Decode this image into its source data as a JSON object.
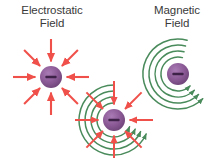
{
  "figure": {
    "background_color": "#ffffff",
    "width": 215,
    "height": 158,
    "type": "scientific-illustration"
  },
  "labels": {
    "electrostatic": "Electrostatic\nField",
    "magnetic": "Magnetic\nField"
  },
  "colors": {
    "charge_fill": "#8B5A96",
    "charge_fill_light": "#A36FAE",
    "charge_fill_dark": "#6E4478",
    "charge_sign": "#3F2248",
    "arrow_red": "#F0504A",
    "field_green": "#4A8B5C",
    "label_text": "#3a3a3a"
  },
  "diagrams": [
    {
      "id": "electrostatic",
      "name": "electrostatic-field-diagram",
      "charge_sign": "minus",
      "charge_radius": 11,
      "arrow_count": 8,
      "arrow_direction": "inward",
      "arrow_angles_deg": [
        0,
        45,
        90,
        135,
        180,
        225,
        270,
        315
      ],
      "field_rings": 0
    },
    {
      "id": "combined",
      "name": "combined-field-diagram",
      "charge_sign": "minus",
      "charge_radius": 11,
      "arrow_count": 8,
      "arrow_direction": "inward",
      "arrow_angles_deg": [
        0,
        45,
        90,
        135,
        180,
        225,
        270,
        315
      ],
      "field_rings": 4,
      "ring_radii": [
        17,
        23,
        29,
        35
      ]
    },
    {
      "id": "magnetic",
      "name": "magnetic-field-diagram",
      "charge_sign": "minus",
      "charge_radius": 11,
      "arrow_count": 0,
      "field_rings": 4,
      "ring_radii": [
        17,
        23,
        29,
        35
      ],
      "ring_direction": "counterclockwise"
    }
  ]
}
